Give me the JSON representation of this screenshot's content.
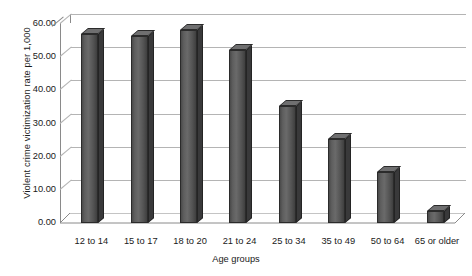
{
  "chart_data": {
    "type": "bar",
    "title": "",
    "subtitle": "",
    "xlabel": "Age groups",
    "ylabel": "Violent crime victimization rate per 1,000",
    "categories": [
      "12 to 14",
      "15 to 17",
      "18 to 20",
      "21 to 24",
      "25 to 34",
      "35 to 49",
      "50 to 64",
      "65 or older"
    ],
    "values": [
      57.0,
      56.5,
      58.3,
      52.3,
      35.3,
      25.4,
      15.5,
      3.5
    ],
    "ylim": [
      0.0,
      60.0
    ],
    "ytick_values": [
      0.0,
      10.0,
      20.0,
      30.0,
      40.0,
      50.0,
      60.0
    ],
    "ytick_labels": [
      "0.00",
      "10.00",
      "20.00",
      "30.00",
      "40.00",
      "50.00",
      "60.00"
    ],
    "grid": true,
    "legend": false,
    "legend_position": "none",
    "style": "3d-column",
    "bar_color": "#5e5e5e",
    "bar_top_color": "#6f6f70",
    "bar_side_color": "#39393a",
    "gridline_color": "#b4b4b4",
    "axis_color": "#8a8a8a",
    "background_color": "#ffffff",
    "text_color": "#1a1a1a"
  }
}
